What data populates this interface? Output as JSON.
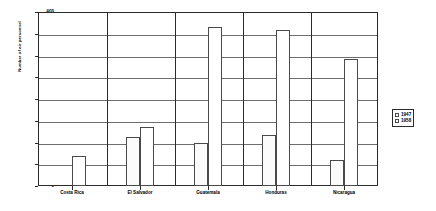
{
  "chart_data": {
    "type": "bar",
    "title": "",
    "xlabel": "",
    "ylabel": "Number of air personnel",
    "categories": [
      "Costa Rica",
      "El Salvador",
      "Guatemala",
      "Honduras",
      "Nicaragua"
    ],
    "series": [
      {
        "name": "1947",
        "values": [
          0,
          112,
          100,
          117,
          60
        ]
      },
      {
        "name": "1958",
        "values": [
          70,
          135,
          365,
          358,
          293
        ]
      }
    ],
    "ylim": [
      0,
      400
    ],
    "yticks": [
      0,
      50,
      100,
      150,
      200,
      250,
      300,
      350,
      400
    ],
    "ytick_labels": [
      "0",
      "50",
      "100",
      "150",
      "200",
      "250",
      "300",
      "350",
      "400"
    ],
    "grid": true,
    "legend_position": "right",
    "legend_entries": [
      "1947",
      "1958"
    ],
    "colors": {
      "series_1947": "#fbfbfb",
      "series_1958": "#ffffff",
      "axis": "#2b2b2b",
      "grid": "#6e6e6e"
    }
  }
}
